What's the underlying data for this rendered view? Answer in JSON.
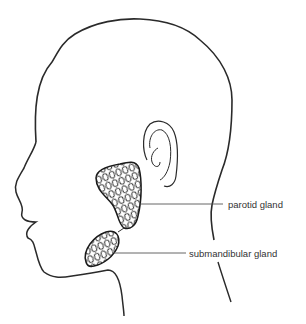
{
  "diagram": {
    "labels": [
      {
        "id": "parotid",
        "text": "parotid gland"
      },
      {
        "id": "submandibular",
        "text": "submandibular gland"
      }
    ],
    "colors": {
      "line": "#2a2a2a",
      "leader": "#555555",
      "background": "#ffffff"
    }
  }
}
